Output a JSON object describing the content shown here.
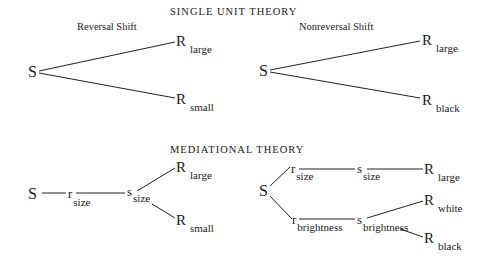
{
  "single_unit": {
    "title": "SINGLE UNIT THEORY",
    "reversal": {
      "label": "Reversal Shift",
      "stimulus": "S",
      "responses": [
        {
          "symbol": "R",
          "subscript": "large"
        },
        {
          "symbol": "R",
          "subscript": "small"
        }
      ]
    },
    "nonreversal": {
      "label": "Nonreversal Shift",
      "stimulus": "S",
      "responses": [
        {
          "symbol": "R",
          "subscript": "large"
        },
        {
          "symbol": "R",
          "subscript": "black"
        }
      ]
    }
  },
  "mediational": {
    "title": "MEDIATIONAL THEORY",
    "reversal": {
      "stimulus": "S",
      "mediator_r": {
        "symbol": "r",
        "subscript": "size"
      },
      "mediator_s": {
        "symbol": "s",
        "subscript": "size"
      },
      "responses": [
        {
          "symbol": "R",
          "subscript": "large"
        },
        {
          "symbol": "R",
          "subscript": "small"
        }
      ]
    },
    "nonreversal": {
      "stimulus": "S",
      "upper_r": {
        "symbol": "r",
        "subscript": "size"
      },
      "upper_s": {
        "symbol": "s",
        "subscript": "size"
      },
      "upper_response": {
        "symbol": "R",
        "subscript": "large"
      },
      "lower_r": {
        "symbol": "r",
        "subscript": "brightness"
      },
      "lower_s": {
        "symbol": "s",
        "subscript": "brightness"
      },
      "lower_responses": [
        {
          "symbol": "R",
          "subscript": "white"
        },
        {
          "symbol": "R",
          "subscript": "black"
        }
      ]
    }
  }
}
